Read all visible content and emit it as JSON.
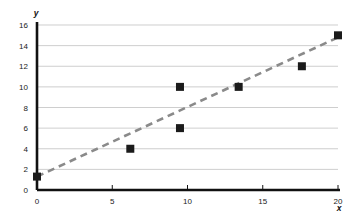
{
  "chart_data": {
    "type": "scatter",
    "title": "",
    "xlabel": "x",
    "ylabel": "y",
    "xlim": [
      0,
      20
    ],
    "ylim": [
      0,
      16
    ],
    "grid": true,
    "legend": false,
    "x_ticks": [
      0,
      5,
      10,
      15,
      20
    ],
    "y_ticks": [
      0,
      2,
      4,
      6,
      8,
      10,
      12,
      14,
      16
    ],
    "x_tick_labels": [
      "0",
      "5",
      "10",
      "15",
      "20"
    ],
    "y_tick_labels": [
      "0",
      "2",
      "4",
      "6",
      "8",
      "10",
      "12",
      "14",
      "16"
    ],
    "series": [
      {
        "name": "data points",
        "type": "scatter",
        "marker": "square",
        "color": "#1b1b1b",
        "points": [
          {
            "x": 0.0,
            "y": 1.3
          },
          {
            "x": 6.2,
            "y": 4.0
          },
          {
            "x": 9.5,
            "y": 10.0
          },
          {
            "x": 9.5,
            "y": 6.0
          },
          {
            "x": 13.4,
            "y": 10.0
          },
          {
            "x": 17.6,
            "y": 12.0
          },
          {
            "x": 20.0,
            "y": 15.0
          }
        ]
      },
      {
        "name": "trend line",
        "type": "line",
        "style": "dashed",
        "color": "#8a8a8a",
        "points": [
          {
            "x": 0.0,
            "y": 1.3
          },
          {
            "x": 20.0,
            "y": 14.8
          }
        ]
      }
    ]
  }
}
